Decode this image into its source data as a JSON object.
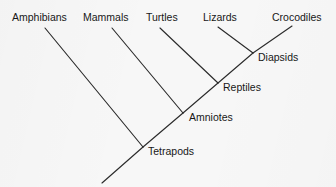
{
  "figure": {
    "kind": "cladogram",
    "background_color": "#f7f7f7",
    "line_color": "#2b2b2b",
    "text_color": "#171717"
  },
  "taxa": [
    {
      "id": "amphibians",
      "label": "Amphibians",
      "label_x": 12,
      "label_y": 21,
      "tip_x": 45,
      "tip_y": 28
    },
    {
      "id": "mammals",
      "label": "Mammals",
      "label_x": 83,
      "label_y": 21,
      "tip_x": 112,
      "tip_y": 28
    },
    {
      "id": "turtles",
      "label": "Turtles",
      "label_x": 146,
      "label_y": 21,
      "tip_x": 160,
      "tip_y": 28
    },
    {
      "id": "lizards",
      "label": "Lizards",
      "label_x": 203,
      "label_y": 21,
      "tip_x": 218,
      "tip_y": 27
    },
    {
      "id": "crocodiles",
      "label": "Crocodiles",
      "label_x": 272,
      "label_y": 21,
      "tip_x": 292,
      "tip_y": 26
    }
  ],
  "clades": [
    {
      "id": "diapsids",
      "label": "Diapsids",
      "node_x": 253,
      "node_y": 53,
      "label_x": 258,
      "label_y": 61
    },
    {
      "id": "reptiles",
      "label": "Reptiles",
      "node_x": 218,
      "node_y": 83,
      "label_x": 223,
      "label_y": 91
    },
    {
      "id": "amniotes",
      "label": "Amniotes",
      "node_x": 183,
      "node_y": 113,
      "label_x": 189,
      "label_y": 121
    },
    {
      "id": "tetrapods",
      "label": "Tetrapods",
      "node_x": 143,
      "node_y": 147,
      "label_x": 148,
      "label_y": 155
    }
  ],
  "root": {
    "id": "root",
    "x": 102,
    "y": 183
  },
  "branches": [
    {
      "id": "branch-amphibians",
      "from": [
        45,
        28
      ],
      "to": [
        143,
        147
      ]
    },
    {
      "id": "branch-mammals",
      "from": [
        112,
        28
      ],
      "to": [
        183,
        113
      ]
    },
    {
      "id": "branch-turtles",
      "from": [
        160,
        28
      ],
      "to": [
        218,
        83
      ]
    },
    {
      "id": "branch-lizards",
      "from": [
        218,
        27
      ],
      "to": [
        253,
        53
      ]
    },
    {
      "id": "branch-crocodiles",
      "from": [
        292,
        26
      ],
      "to": [
        253,
        53
      ]
    },
    {
      "id": "branch-diapsids-to-reptiles",
      "from": [
        253,
        53
      ],
      "to": [
        218,
        83
      ]
    },
    {
      "id": "branch-reptiles-to-amniotes",
      "from": [
        218,
        83
      ],
      "to": [
        183,
        113
      ]
    },
    {
      "id": "branch-amniotes-to-tetrapods",
      "from": [
        183,
        113
      ],
      "to": [
        143,
        147
      ]
    },
    {
      "id": "branch-root-stem",
      "from": [
        143,
        147
      ],
      "to": [
        102,
        183
      ]
    }
  ]
}
